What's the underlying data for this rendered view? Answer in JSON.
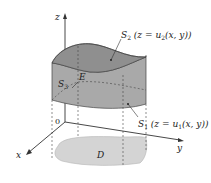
{
  "diagram": {
    "type": "3d-region-type1",
    "axes": {
      "x": "x",
      "y": "y",
      "z": "z",
      "origin": "0"
    },
    "labels": {
      "top_surface": {
        "name": "S",
        "sub": "2",
        "rest": " (z = u",
        "rest_sub": "2",
        "tail": "(x, y))"
      },
      "bottom_surface": {
        "name": "S",
        "sub": "1",
        "rest": " (z = u",
        "rest_sub": "1",
        "tail": "(x, y))"
      },
      "side_surface": {
        "name": "S",
        "sub": "3"
      },
      "solid": "E",
      "projection": "D"
    },
    "colors": {
      "top_surface": "#8f8f8f",
      "side_surface": "#a9a9a9",
      "side_surface_front": "#9e9e9e",
      "projection_region": "#d4d4d4",
      "lines": "#333333",
      "dashed": "#444444"
    }
  }
}
